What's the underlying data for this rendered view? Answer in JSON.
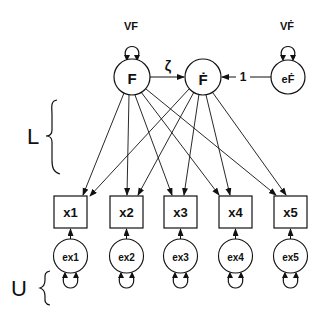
{
  "diagram": {
    "type": "path-diagram",
    "latent": [
      {
        "id": "F",
        "label": "F",
        "variance_label": "VF"
      },
      {
        "id": "Fdot",
        "label": "Ḟ"
      },
      {
        "id": "eF",
        "label": "eḞ",
        "variance_label": "VḞ"
      }
    ],
    "paths": {
      "F_to_Fdot": "ζ",
      "eF_to_Fdot": "1"
    },
    "observed": [
      {
        "id": "x1",
        "label": "x1",
        "error": "ex1"
      },
      {
        "id": "x2",
        "label": "x2",
        "error": "ex2"
      },
      {
        "id": "x3",
        "label": "x3",
        "error": "ex3"
      },
      {
        "id": "x4",
        "label": "x4",
        "error": "ex4"
      },
      {
        "id": "x5",
        "label": "x5",
        "error": "ex5"
      }
    ],
    "brace_labels": {
      "loadings": "L",
      "uniqueness": "U"
    },
    "colors": {
      "stroke": "#111111",
      "background": "#ffffff"
    }
  }
}
